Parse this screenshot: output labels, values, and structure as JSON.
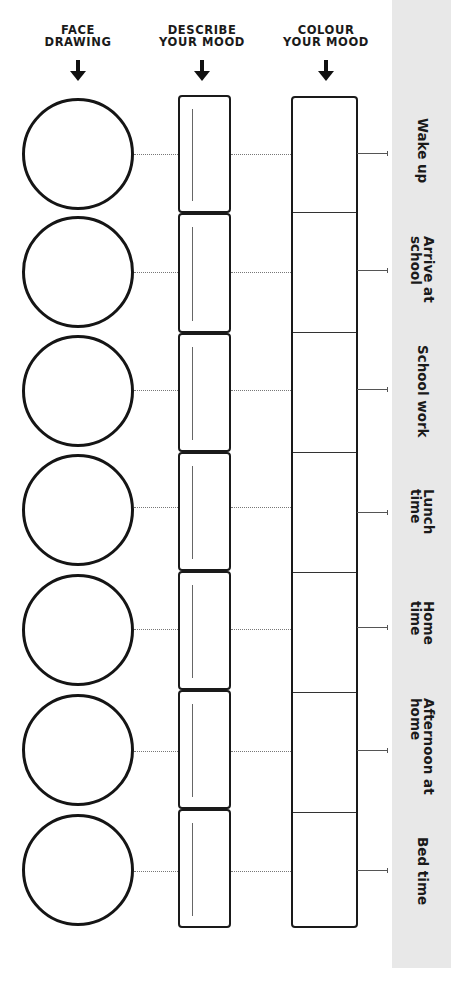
{
  "headings": {
    "face": [
      "FACE",
      "DRAWING"
    ],
    "describe": [
      "DESCRIBE",
      "YOUR MOOD"
    ],
    "colour": [
      "COLOUR",
      "YOUR MOOD"
    ]
  },
  "arrow_icon": "down-arrow-icon",
  "colors": {
    "panel": "#e8e8e8",
    "ink": "#1a1a1a"
  },
  "rows": [
    {
      "label_lines": [
        "Wake up"
      ]
    },
    {
      "label_lines": [
        "Arrive at",
        "school"
      ]
    },
    {
      "label_lines": [
        "School work"
      ]
    },
    {
      "label_lines": [
        "Lunch",
        "time"
      ]
    },
    {
      "label_lines": [
        "Home",
        "time"
      ]
    },
    {
      "label_lines": [
        "Afternoon at",
        "home"
      ]
    },
    {
      "label_lines": [
        "Bed time"
      ]
    }
  ]
}
